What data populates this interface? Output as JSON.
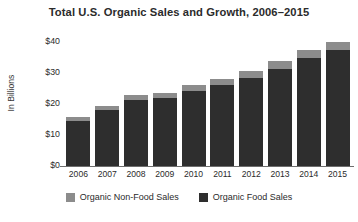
{
  "chart_data": {
    "type": "bar",
    "subtype": "stacked-vertical",
    "title": "Total U.S. Organic Sales and Growth, 2006–2015",
    "xlabel": "",
    "ylabel": "In Billions",
    "categories": [
      "2006",
      "2007",
      "2008",
      "2009",
      "2010",
      "2011",
      "2012",
      "2013",
      "2014",
      "2015"
    ],
    "series": [
      {
        "name": "Organic Food Sales",
        "color": "#2e2e2e",
        "values": [
          14.7,
          18.0,
          21.5,
          22.0,
          24.3,
          26.2,
          28.6,
          31.5,
          35.1,
          37.5
        ]
      },
      {
        "name": "Organic Non-Food Sales",
        "color": "#8c8c8c",
        "values": [
          1.3,
          1.5,
          1.6,
          1.7,
          1.9,
          2.0,
          2.2,
          2.4,
          2.5,
          2.5
        ]
      }
    ],
    "totals": [
      16.0,
      19.5,
      23.1,
      23.7,
      26.2,
      28.2,
      30.8,
      33.9,
      37.6,
      40.0
    ],
    "ylim": [
      0,
      44
    ],
    "yticks": [
      "$0",
      "$10",
      "$20",
      "$30",
      "$40"
    ],
    "ytick_values": [
      0,
      10,
      20,
      30,
      40
    ],
    "grid": false,
    "legend_position": "bottom",
    "legend": [
      {
        "label": "Organic Non-Food Sales",
        "color": "#8c8c8c"
      },
      {
        "label": "Organic Food Sales",
        "color": "#2e2e2e"
      }
    ]
  }
}
